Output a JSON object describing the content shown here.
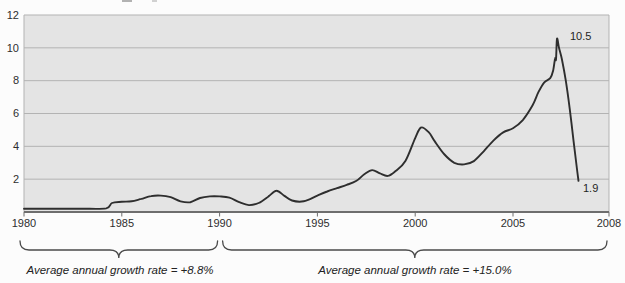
{
  "chart_data": {
    "type": "line",
    "title": "",
    "xlabel": "",
    "ylabel": "",
    "x_axis": {
      "ticks": [
        1980,
        1985,
        1990,
        1995,
        2000,
        2005,
        2008
      ],
      "range_years": [
        1980,
        2009.9
      ],
      "last_tick_at_plot_edge": true
    },
    "y_axis": {
      "ticks": [
        2,
        4,
        6,
        8,
        10,
        12
      ],
      "range": [
        0,
        12
      ],
      "gridlines": true
    },
    "series": [
      {
        "name": "main-line",
        "points": [
          [
            1980,
            0.2
          ],
          [
            1981,
            0.2
          ],
          [
            1982,
            0.2
          ],
          [
            1983,
            0.2
          ],
          [
            1984.2,
            0.22
          ],
          [
            1984.5,
            0.55
          ],
          [
            1985,
            0.62
          ],
          [
            1985.5,
            0.65
          ],
          [
            1986,
            0.8
          ],
          [
            1986.5,
            0.97
          ],
          [
            1987,
            1.0
          ],
          [
            1987.5,
            0.9
          ],
          [
            1988,
            0.65
          ],
          [
            1988.5,
            0.6
          ],
          [
            1989,
            0.85
          ],
          [
            1989.5,
            0.95
          ],
          [
            1990,
            0.95
          ],
          [
            1990.5,
            0.88
          ],
          [
            1991,
            0.6
          ],
          [
            1991.5,
            0.42
          ],
          [
            1992,
            0.55
          ],
          [
            1992.5,
            0.95
          ],
          [
            1992.9,
            1.3
          ],
          [
            1993.3,
            1.0
          ],
          [
            1993.7,
            0.7
          ],
          [
            1994.3,
            0.65
          ],
          [
            1995,
            1.0
          ],
          [
            1995.5,
            1.25
          ],
          [
            1996,
            1.45
          ],
          [
            1996.5,
            1.65
          ],
          [
            1997,
            1.9
          ],
          [
            1997.4,
            2.3
          ],
          [
            1997.8,
            2.55
          ],
          [
            1998.2,
            2.35
          ],
          [
            1998.6,
            2.2
          ],
          [
            1999,
            2.5
          ],
          [
            1999.5,
            3.1
          ],
          [
            2000,
            4.5
          ],
          [
            2000.3,
            5.15
          ],
          [
            2000.7,
            4.85
          ],
          [
            2001,
            4.3
          ],
          [
            2001.5,
            3.5
          ],
          [
            2002,
            3.0
          ],
          [
            2002.5,
            2.9
          ],
          [
            2003,
            3.1
          ],
          [
            2003.5,
            3.7
          ],
          [
            2004,
            4.35
          ],
          [
            2004.5,
            4.85
          ],
          [
            2005,
            5.1
          ],
          [
            2005.5,
            5.6
          ],
          [
            2006,
            6.5
          ],
          [
            2006.3,
            7.3
          ],
          [
            2006.6,
            7.9
          ],
          [
            2006.9,
            8.15
          ],
          [
            2007.05,
            8.6
          ],
          [
            2007.15,
            9.35
          ],
          [
            2007.2,
            9.3
          ],
          [
            2007.25,
            10.55
          ],
          [
            2007.35,
            10.0
          ],
          [
            2007.5,
            9.3
          ],
          [
            2007.7,
            8.0
          ],
          [
            2007.9,
            6.3
          ],
          [
            2008.1,
            4.3
          ],
          [
            2008.25,
            2.8
          ],
          [
            2008.35,
            1.9
          ]
        ]
      }
    ],
    "point_labels": [
      {
        "text": "10.5",
        "value": 10.5,
        "anchor_year": 2007.25
      },
      {
        "text": "1.9",
        "value": 1.9,
        "anchor_year": 2008.35
      }
    ],
    "growth_annotations": [
      {
        "text": "Average annual growth rate = +8.8%",
        "span_years": [
          1980,
          1990
        ]
      },
      {
        "text": "Average annual growth rate = +15.0%",
        "span_years": [
          1990,
          2008
        ]
      }
    ],
    "legend": "none"
  },
  "colors": {
    "plot_background": "#e4e4e4",
    "plot_border": "#b3b3b3",
    "gridline": "#b3b3b3",
    "axis_baseline": "#6e6e6e",
    "line": "#2e2e2e",
    "brace": "#4a4a4a",
    "label_text": "#2e2e2e"
  }
}
